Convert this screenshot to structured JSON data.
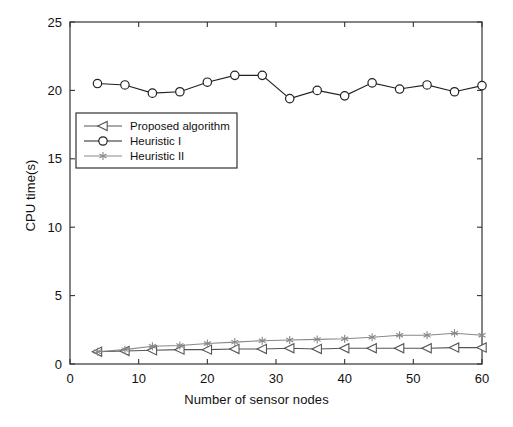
{
  "chart_data": {
    "type": "line",
    "title": "",
    "xlabel": "Number of sensor nodes",
    "ylabel": "CPU time(s)",
    "xlim": [
      0,
      60
    ],
    "ylim": [
      0,
      25
    ],
    "xticks": [
      0,
      10,
      20,
      30,
      40,
      50,
      60
    ],
    "yticks": [
      0,
      5,
      10,
      15,
      20,
      25
    ],
    "xticklabels": [
      "0",
      "10",
      "20",
      "30",
      "40",
      "50",
      "60"
    ],
    "yticklabels": [
      "0",
      "5",
      "10",
      "15",
      "20",
      "25"
    ],
    "grid": false,
    "legend_position": "upper-left-inside",
    "x": [
      4,
      8,
      12,
      16,
      20,
      24,
      28,
      32,
      36,
      40,
      44,
      48,
      52,
      56,
      60
    ],
    "series": [
      {
        "name": "Proposed algorithm",
        "marker": "left-triangle",
        "color": "#555555",
        "values": [
          0.9,
          0.95,
          1.0,
          1.05,
          1.05,
          1.1,
          1.1,
          1.15,
          1.1,
          1.15,
          1.15,
          1.15,
          1.15,
          1.2,
          1.2
        ]
      },
      {
        "name": "Heuristic I",
        "marker": "circle",
        "color": "#222222",
        "values": [
          20.5,
          20.4,
          19.8,
          19.9,
          20.6,
          21.1,
          21.1,
          19.4,
          20.0,
          19.6,
          20.55,
          20.1,
          20.4,
          19.9,
          20.35
        ]
      },
      {
        "name": "Heuristic II",
        "marker": "asterisk",
        "color": "#888888",
        "values": [
          0.9,
          1.05,
          1.3,
          1.35,
          1.5,
          1.6,
          1.7,
          1.75,
          1.8,
          1.85,
          1.95,
          2.1,
          2.1,
          2.25,
          2.1
        ]
      }
    ]
  },
  "legend": {
    "entries": [
      {
        "label": "Proposed algorithm"
      },
      {
        "label": "Heuristic I"
      },
      {
        "label": "Heuristic II"
      }
    ]
  }
}
